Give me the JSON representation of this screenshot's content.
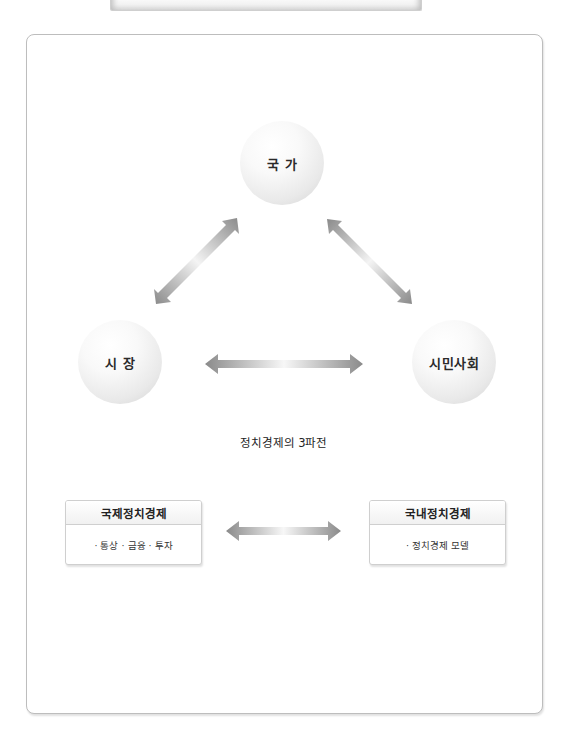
{
  "diagram": {
    "caption": "정치경제의 3파전",
    "nodes": [
      {
        "id": "state",
        "label": "국 가"
      },
      {
        "id": "market",
        "label": "시 장"
      },
      {
        "id": "civil_society",
        "label": "시민사회"
      }
    ],
    "edges": [
      {
        "from": "state",
        "to": "market",
        "type": "bidirectional"
      },
      {
        "from": "state",
        "to": "civil_society",
        "type": "bidirectional"
      },
      {
        "from": "market",
        "to": "civil_society",
        "type": "bidirectional"
      }
    ],
    "boxes": [
      {
        "title": "국제정치경제",
        "items": "· 통상 · 금융 · 투자"
      },
      {
        "title": "국내정치경제",
        "items": "· 정치경제 모델"
      }
    ],
    "box_edge": {
      "from": "국제정치경제",
      "to": "국내정치경제",
      "type": "bidirectional"
    }
  },
  "colors": {
    "arrow_dark": "#8a8a8a",
    "arrow_light": "#f4f4f4",
    "frame_border": "#bdbdbd"
  }
}
